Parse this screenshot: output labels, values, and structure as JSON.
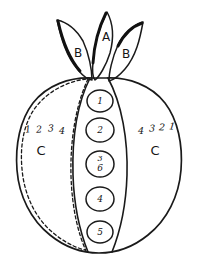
{
  "figure": {
    "kind": "hand-drawn-botanical-diagram",
    "ink_color": "#1a1a1a",
    "background_color": "#ffffff"
  },
  "leaves": [
    {
      "id": "leaf-left",
      "label": "B",
      "position": "left"
    },
    {
      "id": "leaf-center",
      "label": "A",
      "position": "center"
    },
    {
      "id": "leaf-right",
      "label": "B",
      "position": "right"
    }
  ],
  "body": {
    "left_segment": {
      "label": "C",
      "rib_numbers": [
        "1",
        "2",
        "3",
        "4"
      ]
    },
    "right_segment": {
      "label": "C",
      "rib_numbers": [
        "4",
        "3",
        "2",
        "1"
      ]
    },
    "center_segment": {
      "circles": [
        {
          "value": "1"
        },
        {
          "value": "2"
        },
        {
          "value": "3",
          "overwritten_value": "6"
        },
        {
          "value": "4"
        },
        {
          "value": "5"
        }
      ]
    }
  }
}
